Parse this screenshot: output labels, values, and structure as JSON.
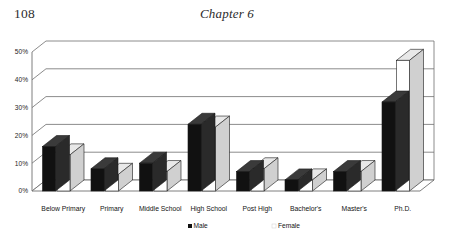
{
  "page": {
    "number": "108",
    "chapter": "Chapter 6"
  },
  "chart_data": {
    "type": "bar",
    "title": "",
    "xlabel": "",
    "ylabel": "",
    "ylim": [
      0,
      50
    ],
    "ytick_labels": [
      "0%",
      "10%",
      "20%",
      "30%",
      "40%",
      "50%"
    ],
    "ytick_values": [
      0,
      10,
      20,
      30,
      40,
      50
    ],
    "grid": true,
    "legend_position": "bottom",
    "style": "3d-clustered-column",
    "categories": [
      "Below Primary",
      "Primary",
      "Middle School",
      "High School",
      "Post High",
      "Bachelor's",
      "Master's",
      "Ph.D."
    ],
    "series": [
      {
        "name": "Male",
        "color": "#111111",
        "values": [
          16,
          8,
          10,
          24,
          7,
          4,
          7,
          32
        ]
      },
      {
        "name": "Female",
        "color": "#ffffff",
        "values": [
          13,
          6,
          7,
          23,
          8,
          4,
          7,
          47
        ]
      }
    ]
  },
  "legend": {
    "male_label": "Male",
    "female_label": "Female"
  }
}
